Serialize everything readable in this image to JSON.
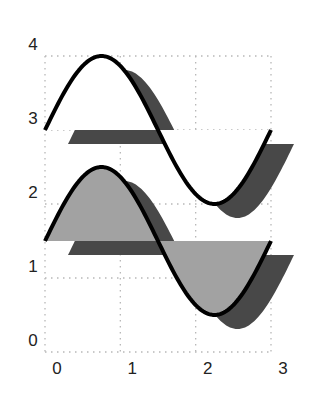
{
  "chart_data": {
    "type": "area",
    "title": "",
    "xlabel": "",
    "ylabel": "",
    "xlim": [
      0,
      3
    ],
    "ylim": [
      0,
      4
    ],
    "grid": true,
    "legend": null,
    "x_ticks": [
      "0",
      "1",
      "2",
      "3"
    ],
    "y_ticks": [
      "0",
      "1",
      "2",
      "3",
      "4"
    ],
    "style": "filled sine curves with offset drop shadow",
    "series": [
      {
        "name": "upper",
        "formula": "y = 3 + sin(2*pi*x/3)",
        "baseline": 3,
        "fill": "#ffffff",
        "line": "#000000",
        "shadow": "#484848",
        "x": [
          0,
          0.25,
          0.5,
          0.75,
          1.0,
          1.25,
          1.5,
          1.75,
          2.0,
          2.25,
          2.5,
          2.75,
          3.0
        ],
        "values": [
          3.0,
          3.5,
          3.87,
          4.0,
          3.87,
          3.5,
          3.0,
          2.5,
          2.13,
          2.0,
          2.13,
          2.5,
          3.0
        ]
      },
      {
        "name": "lower",
        "formula": "y = 1.5 + sin(2*pi*x/3)",
        "baseline": 1.5,
        "fill": "#a2a2a2",
        "line": "#000000",
        "shadow": "#484848",
        "x": [
          0,
          0.25,
          0.5,
          0.75,
          1.0,
          1.25,
          1.5,
          1.75,
          2.0,
          2.25,
          2.5,
          2.75,
          3.0
        ],
        "values": [
          1.5,
          2.0,
          2.37,
          2.5,
          2.37,
          2.0,
          1.5,
          1.0,
          0.63,
          0.5,
          0.63,
          1.0,
          1.5
        ]
      }
    ]
  }
}
